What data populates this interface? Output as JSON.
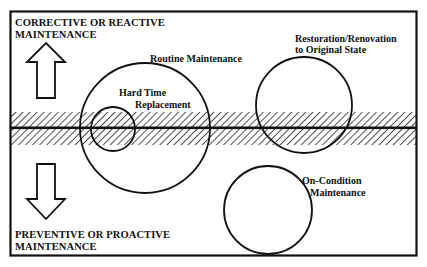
{
  "diagram": {
    "type": "maintenance-strategy-diagram",
    "top_label": {
      "line1": "CORRECTIVE OR REACTIVE",
      "line2": "MAINTENANCE"
    },
    "bottom_label": {
      "line1": "PREVENTIVE OR PROACTIVE",
      "line2": "MAINTENANCE"
    },
    "arrows": [
      {
        "id": "up",
        "direction": "up",
        "meaning": "toward corrective/reactive"
      },
      {
        "id": "down",
        "direction": "down",
        "meaning": "toward preventive/proactive"
      }
    ],
    "circles": [
      {
        "id": "routine",
        "label": "Routine Maintenance"
      },
      {
        "id": "hard_time",
        "label_line1": "Hard Time",
        "label_line2": "Replacement"
      },
      {
        "id": "restoration",
        "label_line1": "Restoration/Renovation",
        "label_line2": "to Original State"
      },
      {
        "id": "on_condition",
        "label_line1": "On-Condition",
        "label_line2": "Maintenance"
      }
    ],
    "divider": {
      "style": "hatched band with center line"
    },
    "colors": {
      "ink": "#111111",
      "background": "#ffffff"
    }
  }
}
